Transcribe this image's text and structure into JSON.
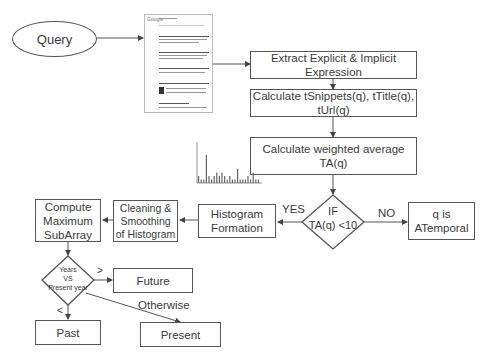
{
  "start": {
    "label": "Query"
  },
  "steps": {
    "extract": "Extract Explicit & Implicit Expression",
    "calculate": "Calculate tSnippets(q), tTitle(q), tUrl(q)",
    "weighted_line1": "Calculate weighted average",
    "weighted_line2": "TA(q)",
    "histogram_line1": "Histogram",
    "histogram_line2": "Formation",
    "cleaning_line1": "Cleaning &",
    "cleaning_line2": "Smoothing",
    "cleaning_line3": "of Histogram",
    "compute_line1": "Compute",
    "compute_line2": "Maximum",
    "compute_line3": "SubArray"
  },
  "decision_ta": {
    "line1": "IF",
    "line2": "TA(q) <10",
    "yes": "YES",
    "no": "NO"
  },
  "atemporal": {
    "line1": "q is",
    "line2": "ATemporal"
  },
  "decision_years": {
    "line1": "Years",
    "line2": "VS",
    "line3": "Present year",
    "gt": ">",
    "lt": "<",
    "otherwise": "Otherwise"
  },
  "outcomes": {
    "future": "Future",
    "past": "Past",
    "present": "Present"
  },
  "thumbnail": {
    "logo": "Google"
  },
  "histogram_thumbnail": {
    "bars": [
      2,
      1,
      1,
      8,
      2,
      1,
      2,
      3,
      2,
      3,
      2,
      1,
      2,
      1,
      1,
      4,
      1,
      1,
      1,
      2,
      1,
      3,
      1,
      1
    ]
  }
}
